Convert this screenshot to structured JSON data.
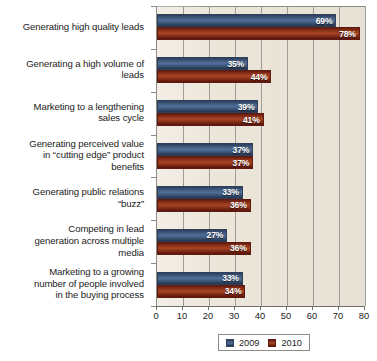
{
  "chart_data": {
    "type": "bar",
    "orientation": "horizontal",
    "title": "",
    "xlabel": "",
    "ylabel": "",
    "xlim": [
      0,
      80
    ],
    "xticks": [
      0,
      10,
      20,
      30,
      40,
      50,
      60,
      70,
      80
    ],
    "xtick_labels": [
      "0",
      "10",
      "20",
      "30",
      "40",
      "50",
      "60",
      "70",
      "80"
    ],
    "grid": true,
    "grid_axis": "x",
    "value_suffix": "%",
    "legend_position": "bottom",
    "categories": [
      "Generating high quality leads",
      "Generating a high volume of leads",
      "Marketing to a lengthening sales cycle",
      "Generating perceived value in “cutting edge” product benefits",
      "Generating public relations “buzz”",
      "Competing in lead generation across multiple media",
      "Marketing to a growing number of people involved in the buying process"
    ],
    "category_lines": [
      [
        "Generating high quality leads"
      ],
      [
        "Generating a high volume of",
        "leads"
      ],
      [
        "Marketing to a lengthening",
        "sales cycle"
      ],
      [
        "Generating perceived value",
        "in “cutting edge” product",
        "benefits"
      ],
      [
        "Generating public relations",
        "“buzz”"
      ],
      [
        "Competing in lead",
        "generation across multiple",
        "media"
      ],
      [
        "Marketing to a growing",
        "number of people involved",
        "in the buying process"
      ]
    ],
    "series": [
      {
        "name": "2009",
        "color": "#3d5578",
        "values": [
          69,
          35,
          39,
          37,
          33,
          27,
          33
        ],
        "labels": [
          "69%",
          "35%",
          "39%",
          "37%",
          "33%",
          "27%",
          "33%"
        ]
      },
      {
        "name": "2010",
        "color": "#8b3017",
        "values": [
          78,
          44,
          41,
          37,
          36,
          36,
          34
        ],
        "labels": [
          "78%",
          "44%",
          "41%",
          "37%",
          "36%",
          "36%",
          "34%"
        ]
      }
    ]
  },
  "legend": {
    "items": [
      {
        "label": "2009",
        "color": "#3d5578"
      },
      {
        "label": "2010",
        "color": "#8b3017"
      }
    ]
  },
  "colors": {
    "plot_background": "#ece5d9",
    "gridline": "#9d9d95",
    "axis": "#6f6f69",
    "series_2009": "#3d5578",
    "series_2010": "#8b3017",
    "value_label": "#ffffff",
    "text": "#1b1b1b"
  }
}
